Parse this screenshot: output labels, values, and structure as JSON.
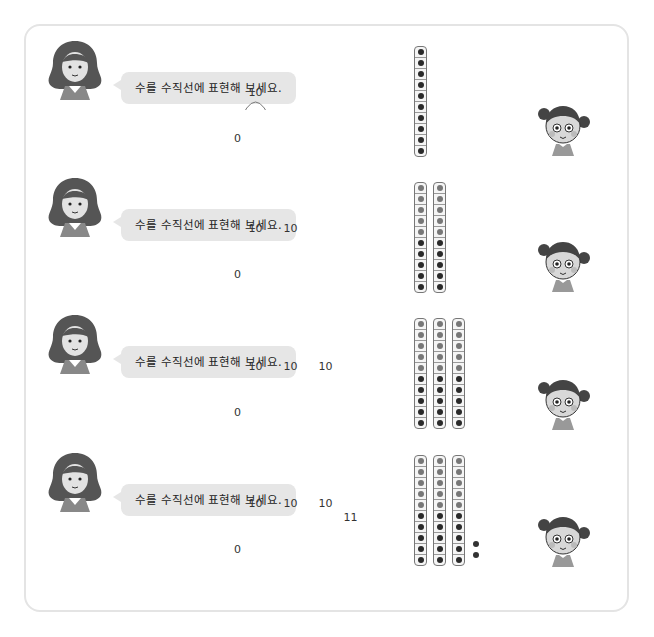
{
  "prompt_text": "수를 수직선에 표현해 보세요.",
  "rows": [
    {
      "prompt": "수를 수직선에 표현해 보세요.",
      "zero_label": "0",
      "jumps": [
        {
          "label": "10",
          "size": 10
        }
      ],
      "tens_sticks": 1,
      "ones": 0
    },
    {
      "prompt": "수를 수직선에 표현해 보세요.",
      "zero_label": "0",
      "jumps": [
        {
          "label": "10",
          "size": 10
        },
        {
          "label": "10",
          "size": 10
        }
      ],
      "tens_sticks": 2,
      "ones": 0
    },
    {
      "prompt": "수를 수직선에 표현해 보세요.",
      "zero_label": "0",
      "jumps": [
        {
          "label": "10",
          "size": 10
        },
        {
          "label": "10",
          "size": 10
        },
        {
          "label": "10",
          "size": 10
        }
      ],
      "tens_sticks": 3,
      "ones": 0
    },
    {
      "prompt": "수를 수직선에 표현해 보세요.",
      "zero_label": "0",
      "jumps": [
        {
          "label": "10",
          "size": 10
        },
        {
          "label": "10",
          "size": 10
        },
        {
          "label": "10",
          "size": 10
        },
        {
          "label": "1",
          "size": 1
        },
        {
          "label": "1",
          "size": 1
        }
      ],
      "tens_sticks": 3,
      "ones": 2
    }
  ],
  "colors": {
    "card_border": "#e4e4e4",
    "bubble_bg": "#e6e6e6",
    "dot_light": "#777777",
    "dot_dark": "#2a2a2a",
    "line": "#111111"
  }
}
